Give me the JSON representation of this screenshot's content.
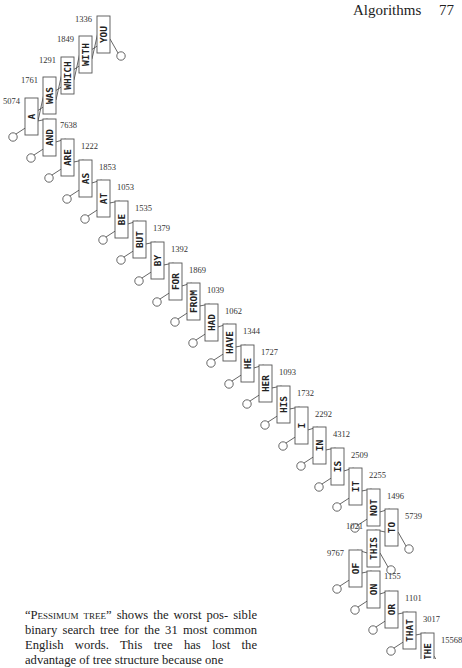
{
  "running_head": {
    "title": "Algorithms",
    "page_number": "77"
  },
  "caption": {
    "figure_name": "Pessimum tree",
    "text_lines": [
      "shows the worst pos-",
      "sible binary search tree for the 31 most",
      "common English words. This tree has lost",
      "the advantage of tree structure because one"
    ]
  },
  "tree": {
    "box_width": 13,
    "box_height": 37,
    "nodes": [
      {
        "word": "YOU",
        "freq": "1336",
        "x": 97,
        "y": 16,
        "label_side": "left",
        "parent": "WITH",
        "child_side": "right"
      },
      {
        "word": "WITH",
        "freq": "1849",
        "x": 79,
        "y": 36,
        "label_side": "left",
        "parent": "WHICH",
        "child_side": "right"
      },
      {
        "word": "WHICH",
        "freq": "1291",
        "x": 61,
        "y": 57,
        "label_side": "left",
        "parent": "WAS",
        "child_side": "right"
      },
      {
        "word": "WAS",
        "freq": "1761",
        "x": 43,
        "y": 77,
        "label_side": "left",
        "parent": "A",
        "child_side": "right"
      },
      {
        "word": "A",
        "freq": "5074",
        "x": 25,
        "y": 98,
        "label_side": "left",
        "parent": null
      },
      {
        "word": "AND",
        "freq": "7638",
        "x": 43,
        "y": 119,
        "label_side": "topright-low",
        "parent": "A",
        "child_side": "right"
      },
      {
        "word": "ARE",
        "freq": "1222",
        "x": 61,
        "y": 139,
        "label_side": "right",
        "parent": "AND"
      },
      {
        "word": "AS",
        "freq": "1853",
        "x": 79,
        "y": 160,
        "label_side": "right",
        "parent": "ARE"
      },
      {
        "word": "AT",
        "freq": "1053",
        "x": 97,
        "y": 180,
        "label_side": "right",
        "parent": "AS"
      },
      {
        "word": "BE",
        "freq": "1535",
        "x": 115,
        "y": 201,
        "label_side": "right",
        "parent": "AT"
      },
      {
        "word": "BUT",
        "freq": "1379",
        "x": 133,
        "y": 221,
        "label_side": "right",
        "parent": "BE"
      },
      {
        "word": "BY",
        "freq": "1392",
        "x": 151,
        "y": 242,
        "label_side": "right",
        "parent": "BUT"
      },
      {
        "word": "FOR",
        "freq": "1869",
        "x": 169,
        "y": 263,
        "label_side": "right",
        "parent": "BY"
      },
      {
        "word": "FROM",
        "freq": "1039",
        "x": 187,
        "y": 283,
        "label_side": "right",
        "parent": "FOR"
      },
      {
        "word": "HAD",
        "freq": "1062",
        "x": 205,
        "y": 304,
        "label_side": "right",
        "parent": "FROM"
      },
      {
        "word": "HAVE",
        "freq": "1344",
        "x": 223,
        "y": 324,
        "label_side": "right",
        "parent": "HAD"
      },
      {
        "word": "HE",
        "freq": "1727",
        "x": 241,
        "y": 345,
        "label_side": "right",
        "parent": "HAVE"
      },
      {
        "word": "HER",
        "freq": "1093",
        "x": 259,
        "y": 365,
        "label_side": "right",
        "parent": "HE"
      },
      {
        "word": "HIS",
        "freq": "1732",
        "x": 277,
        "y": 386,
        "label_side": "right",
        "parent": "HER"
      },
      {
        "word": "I",
        "freq": "2292",
        "x": 295,
        "y": 407,
        "label_side": "right",
        "parent": "HIS"
      },
      {
        "word": "IN",
        "freq": "4312",
        "x": 313,
        "y": 427,
        "label_side": "right",
        "parent": "I"
      },
      {
        "word": "IS",
        "freq": "2509",
        "x": 331,
        "y": 448,
        "label_side": "right",
        "parent": "IN"
      },
      {
        "word": "IT",
        "freq": "2255",
        "x": 349,
        "y": 468,
        "label_side": "right",
        "parent": "IS"
      },
      {
        "word": "NOT",
        "freq": "1496",
        "x": 367,
        "y": 489,
        "label_side": "right",
        "parent": "IT"
      },
      {
        "word": "TO",
        "freq": "5739",
        "x": 385,
        "y": 509,
        "label_side": "right",
        "parent": "NOT"
      },
      {
        "word": "THIS",
        "freq": "1021",
        "x": 367,
        "y": 530,
        "label_side": "topleft",
        "parent": "TO"
      },
      {
        "word": "OF",
        "freq": "9767",
        "x": 349,
        "y": 550,
        "label_side": "left",
        "parent": "THIS"
      },
      {
        "word": "ON",
        "freq": "1155",
        "x": 367,
        "y": 571,
        "label_side": "topright-low",
        "parent": "OF"
      },
      {
        "word": "OR",
        "freq": "1101",
        "x": 385,
        "y": 591,
        "label_side": "right",
        "parent": "ON"
      },
      {
        "word": "THAT",
        "freq": "3017",
        "x": 403,
        "y": 612,
        "label_side": "right",
        "parent": "OR"
      },
      {
        "word": "THE",
        "freq": "15568",
        "x": 421,
        "y": 633,
        "label_side": "right",
        "parent": "THAT"
      }
    ]
  }
}
